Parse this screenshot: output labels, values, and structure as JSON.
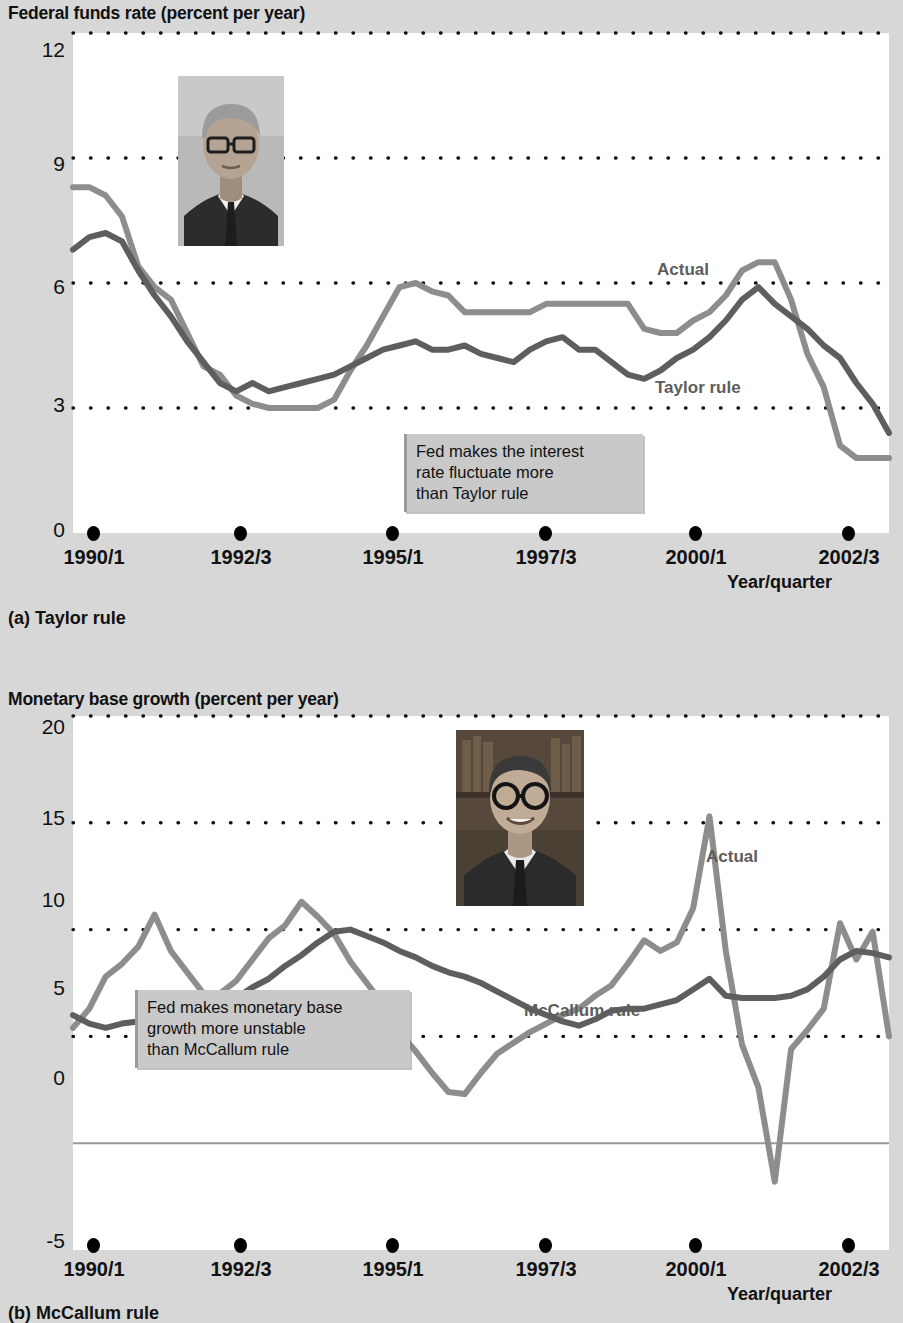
{
  "figure": {
    "panels": [
      {
        "id": "a",
        "caption": "(a) Taylor rule",
        "y_axis_title": "Federal funds rate (percent per year)",
        "x_axis_title": "Year/quarter",
        "portrait_name": "john-taylor-portrait",
        "callout": "Fed makes the interest rate fluctuate more than Taylor rule",
        "callout_lines": [
          "Fed makes the interest",
          "rate fluctuate more",
          "than Taylor rule"
        ],
        "series_labels": {
          "actual": "Actual",
          "rule": "Taylor rule"
        }
      },
      {
        "id": "b",
        "caption": "(b) McCallum rule",
        "y_axis_title": "Monetary base growth (percent per year)",
        "x_axis_title": "Year/quarter",
        "portrait_name": "bennett-mccallum-portrait",
        "callout": "Fed makes monetary base growth more unstable than McCallum rule",
        "callout_lines": [
          "Fed makes monetary base",
          "growth more unstable",
          "than McCallum rule"
        ],
        "series_labels": {
          "actual": "Actual",
          "rule": "McCallum rule"
        }
      }
    ],
    "colors": {
      "actual_line": "#8d8d8d",
      "rule_line": "#5e5e5e",
      "gridline": "#111111",
      "zero_line": "#9a9a9a",
      "plot_background": "#ffffff",
      "page_background": "#d7d7d7",
      "callout_background": "#c9c9c9"
    }
  },
  "chart_data": [
    {
      "type": "line",
      "panel": "a",
      "title": "Federal funds rate (percent per year)",
      "subtitle": "(a) Taylor rule",
      "xlabel": "Year/quarter",
      "ylabel": "Federal funds rate (percent per year)",
      "ylim": [
        0,
        12
      ],
      "yticks": [
        0,
        3,
        6,
        9,
        12
      ],
      "grid": "dotted-horizontal",
      "legend": "inline-annotations",
      "xlim": [
        "1990/1",
        "2002/3"
      ],
      "xticks": [
        "1990/1",
        "1992/3",
        "1995/1",
        "1997/3",
        "2000/1",
        "2002/3"
      ],
      "x": [
        "1990/1",
        "1990/2",
        "1990/3",
        "1990/4",
        "1991/1",
        "1991/2",
        "1991/3",
        "1991/4",
        "1992/1",
        "1992/2",
        "1992/3",
        "1992/4",
        "1993/1",
        "1993/2",
        "1993/3",
        "1993/4",
        "1994/1",
        "1994/2",
        "1994/3",
        "1994/4",
        "1995/1",
        "1995/2",
        "1995/3",
        "1995/4",
        "1996/1",
        "1996/2",
        "1996/3",
        "1996/4",
        "1997/1",
        "1997/2",
        "1997/3",
        "1997/4",
        "1998/1",
        "1998/2",
        "1998/3",
        "1998/4",
        "1999/1",
        "1999/2",
        "1999/3",
        "1999/4",
        "2000/1",
        "2000/2",
        "2000/3",
        "2000/4",
        "2001/1",
        "2001/2",
        "2001/3",
        "2001/4",
        "2002/1",
        "2002/2",
        "2002/3"
      ],
      "series": [
        {
          "name": "Actual",
          "color": "#8d8d8d",
          "values": [
            8.3,
            8.3,
            8.1,
            7.6,
            6.4,
            5.9,
            5.6,
            4.8,
            4.0,
            3.8,
            3.3,
            3.1,
            3.0,
            3.0,
            3.0,
            3.0,
            3.2,
            3.9,
            4.5,
            5.2,
            5.9,
            6.0,
            5.8,
            5.7,
            5.3,
            5.3,
            5.3,
            5.3,
            5.3,
            5.5,
            5.5,
            5.5,
            5.5,
            5.5,
            5.5,
            4.9,
            4.8,
            4.8,
            5.1,
            5.3,
            5.7,
            6.3,
            6.5,
            6.5,
            5.6,
            4.3,
            3.5,
            2.1,
            1.8,
            1.8,
            1.8
          ],
          "annotation": "Actual"
        },
        {
          "name": "Taylor rule",
          "color": "#5e5e5e",
          "values": [
            6.8,
            7.1,
            7.2,
            7.0,
            6.3,
            5.7,
            5.2,
            4.6,
            4.1,
            3.6,
            3.4,
            3.6,
            3.4,
            3.5,
            3.6,
            3.7,
            3.8,
            4.0,
            4.2,
            4.4,
            4.5,
            4.6,
            4.4,
            4.4,
            4.5,
            4.3,
            4.2,
            4.1,
            4.4,
            4.6,
            4.7,
            4.4,
            4.4,
            4.1,
            3.8,
            3.7,
            3.9,
            4.2,
            4.4,
            4.7,
            5.1,
            5.6,
            5.9,
            5.5,
            5.2,
            4.9,
            4.5,
            4.2,
            3.6,
            3.1,
            2.4
          ],
          "annotation": "Taylor rule"
        }
      ],
      "annotations": [
        {
          "text": "Fed makes the interest rate fluctuate more than Taylor rule",
          "kind": "callout-box"
        }
      ]
    },
    {
      "type": "line",
      "panel": "b",
      "title": "Monetary base growth (percent per year)",
      "subtitle": "(b) McCallum rule",
      "xlabel": "Year/quarter",
      "ylabel": "Monetary base growth (percent per year)",
      "ylim": [
        -5,
        20
      ],
      "yticks": [
        -5,
        0,
        5,
        10,
        15,
        20
      ],
      "grid": "dotted-horizontal",
      "legend": "inline-annotations",
      "xlim": [
        "1990/1",
        "2002/3"
      ],
      "xticks": [
        "1990/1",
        "1992/3",
        "1995/1",
        "1997/3",
        "2000/1",
        "2002/3"
      ],
      "x": [
        "1990/1",
        "1990/2",
        "1990/3",
        "1990/4",
        "1991/1",
        "1991/2",
        "1991/3",
        "1991/4",
        "1992/1",
        "1992/2",
        "1992/3",
        "1992/4",
        "1993/1",
        "1993/2",
        "1993/3",
        "1993/4",
        "1994/1",
        "1994/2",
        "1994/3",
        "1994/4",
        "1995/1",
        "1995/2",
        "1995/3",
        "1995/4",
        "1996/1",
        "1996/2",
        "1996/3",
        "1996/4",
        "1997/1",
        "1997/2",
        "1997/3",
        "1997/4",
        "1998/1",
        "1998/2",
        "1998/3",
        "1998/4",
        "1999/1",
        "1999/2",
        "1999/3",
        "1999/4",
        "2000/1",
        "2000/2",
        "2000/3",
        "2000/4",
        "2001/1",
        "2001/2",
        "2001/3",
        "2001/4",
        "2002/1",
        "2002/2",
        "2002/3"
      ],
      "series": [
        {
          "name": "Actual",
          "color": "#8d8d8d",
          "values": [
            5.4,
            6.3,
            7.8,
            8.4,
            9.2,
            10.7,
            9.0,
            8.0,
            7.0,
            7.0,
            7.6,
            8.6,
            9.6,
            10.2,
            11.3,
            10.6,
            9.8,
            8.5,
            7.5,
            6.5,
            5.2,
            4.3,
            3.3,
            2.4,
            2.3,
            3.3,
            4.2,
            4.7,
            5.2,
            5.6,
            6.0,
            6.3,
            6.9,
            7.4,
            8.4,
            9.5,
            9.0,
            9.4,
            11.0,
            15.3,
            9.0,
            4.6,
            2.6,
            -1.8,
            4.4,
            5.3,
            6.3,
            10.3,
            8.6,
            9.9,
            5.0
          ],
          "annotation": "Actual"
        },
        {
          "name": "McCallum rule",
          "color": "#5e5e5e",
          "values": [
            6.0,
            5.6,
            5.4,
            5.6,
            5.7,
            5.8,
            5.9,
            6.2,
            6.4,
            6.5,
            6.8,
            7.3,
            7.7,
            8.3,
            8.8,
            9.4,
            9.9,
            10.0,
            9.7,
            9.4,
            9.0,
            8.7,
            8.3,
            8.0,
            7.8,
            7.5,
            7.1,
            6.7,
            6.3,
            6.0,
            5.7,
            5.5,
            5.8,
            6.2,
            6.3,
            6.3,
            6.5,
            6.7,
            7.2,
            7.7,
            6.9,
            6.8,
            6.8,
            6.8,
            6.9,
            7.2,
            7.8,
            8.6,
            9.0,
            8.9,
            8.7
          ],
          "annotation": "McCallum rule"
        }
      ],
      "annotations": [
        {
          "text": "Fed makes monetary base growth more unstable than McCallum rule",
          "kind": "callout-box"
        }
      ]
    }
  ]
}
